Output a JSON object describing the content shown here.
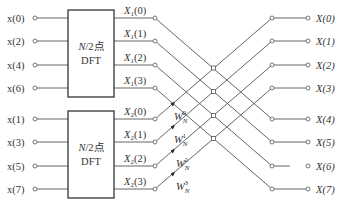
{
  "diagram": {
    "inputs_top": [
      "x(0)",
      "x(2)",
      "x(4)",
      "x(6)"
    ],
    "inputs_bottom": [
      "x(1)",
      "x(3)",
      "x(5)",
      "x(7)"
    ],
    "block_top": {
      "line1_italic": "N",
      "line1_rest": "/2点",
      "line2": "DFT"
    },
    "block_bottom": {
      "line1_italic": "N",
      "line1_rest": "/2点",
      "line2": "DFT"
    },
    "x1_labels": [
      {
        "base": "X",
        "sub": "1",
        "arg": "(0)"
      },
      {
        "base": "X",
        "sub": "1",
        "arg": "(1)"
      },
      {
        "base": "X",
        "sub": "1",
        "arg": "(2)"
      },
      {
        "base": "X",
        "sub": "1",
        "arg": "(3)"
      }
    ],
    "x2_labels": [
      {
        "base": "X",
        "sub": "2",
        "arg": "(0)"
      },
      {
        "base": "X",
        "sub": "2",
        "arg": "(1)"
      },
      {
        "base": "X",
        "sub": "2",
        "arg": "(2)"
      },
      {
        "base": "X",
        "sub": "2",
        "arg": "(3)"
      }
    ],
    "twiddles": [
      {
        "base": "W",
        "sub": "N",
        "sup": "0"
      },
      {
        "base": "W",
        "sub": "N",
        "sup": "1"
      },
      {
        "base": "W",
        "sub": "N",
        "sup": "2"
      },
      {
        "base": "W",
        "sub": "N",
        "sup": "3"
      }
    ],
    "outputs": [
      "X(0)",
      "X(1)",
      "X(2)",
      "X(3)",
      "X(4)",
      "X(5)",
      "X(6)",
      "X(7)"
    ],
    "colors": {
      "line": "#555555",
      "text": "#333333",
      "background": "#ffffff"
    }
  }
}
